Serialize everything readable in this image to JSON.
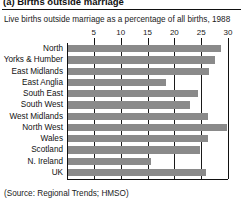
{
  "header": {
    "title": "(a) Births outside marriage"
  },
  "subtitle": "Live births outside marriage as a percentage of all births, 1988",
  "source": "(Source: Regional Trends; HMSO)",
  "chart_data": {
    "type": "bar",
    "orientation": "horizontal",
    "title": "(a) Births outside marriage",
    "subtitle": "Live births outside marriage as a percentage of all births, 1988",
    "xlabel": "",
    "ylabel": "",
    "xlim": [
      0,
      30
    ],
    "xticks": [
      5,
      10,
      15,
      20,
      25,
      30
    ],
    "xtick_labels": [
      "5",
      "10",
      "15",
      "20",
      "25",
      "30"
    ],
    "grid": "vertical",
    "legend": "none",
    "bar_color": "#8a8a8a",
    "categories": [
      "North",
      "Yorks & Humber",
      "East Midlands",
      "East Anglia",
      "South East",
      "South West",
      "West Midlands",
      "North West",
      "Wales",
      "Scotland",
      "N. Ireland",
      "UK"
    ],
    "values": [
      28.7,
      27.6,
      26.4,
      18.4,
      24.5,
      23.0,
      26.2,
      29.8,
      26.2,
      24.7,
      15.6,
      25.9
    ],
    "units": "percent"
  }
}
